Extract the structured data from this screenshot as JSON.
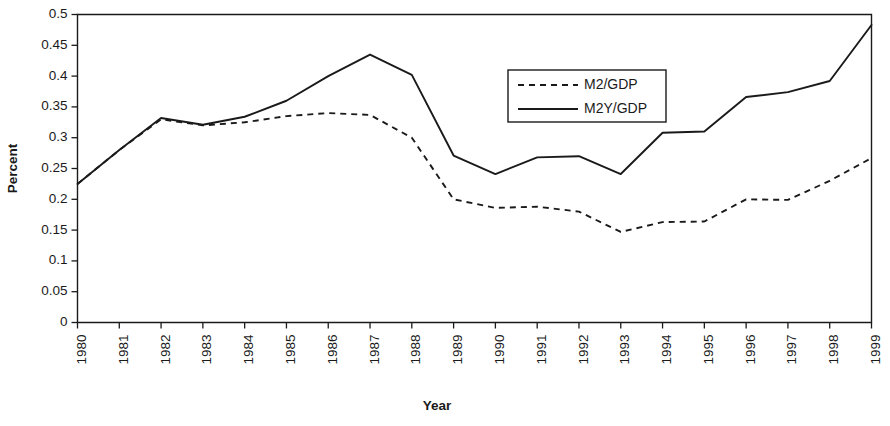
{
  "chart_data": {
    "type": "line",
    "title": "",
    "xlabel": "Year",
    "ylabel": "Percent",
    "grid": false,
    "legend_position": "upper-right-inside",
    "xlim": [
      1980,
      1999
    ],
    "ylim": [
      0,
      0.5
    ],
    "ytick_step": 0.05,
    "ytick_labels": [
      "0",
      "0.05",
      "0.1",
      "0.15",
      "0.2",
      "0.25",
      "0.3",
      "0.35",
      "0.4",
      "0.45",
      "0.5"
    ],
    "ytick_values": [
      0,
      0.05,
      0.1,
      0.15,
      0.2,
      0.25,
      0.3,
      0.35,
      0.4,
      0.45,
      0.5
    ],
    "categories": [
      "1980",
      "1981",
      "1982",
      "1983",
      "1984",
      "1985",
      "1986",
      "1987",
      "1988",
      "1989",
      "1990",
      "1991",
      "1992",
      "1993",
      "1994",
      "1995",
      "1996",
      "1997",
      "1998",
      "1999"
    ],
    "x": [
      1980,
      1981,
      1982,
      1983,
      1984,
      1985,
      1986,
      1987,
      1988,
      1989,
      1990,
      1991,
      1992,
      1993,
      1994,
      1995,
      1996,
      1997,
      1998,
      1999
    ],
    "series": [
      {
        "name": "M2/GDP",
        "style": "dashed",
        "color": "#1a1a1a",
        "values": [
          0.225,
          0.28,
          0.33,
          0.32,
          0.325,
          0.335,
          0.34,
          0.337,
          0.3,
          0.2,
          0.186,
          0.188,
          0.18,
          0.147,
          0.163,
          0.164,
          0.2,
          0.199,
          0.23,
          0.267
        ]
      },
      {
        "name": "M2Y/GDP",
        "style": "solid",
        "color": "#1a1a1a",
        "values": [
          0.225,
          0.28,
          0.332,
          0.321,
          0.334,
          0.36,
          0.4,
          0.435,
          0.402,
          0.271,
          0.241,
          0.268,
          0.27,
          0.241,
          0.308,
          0.31,
          0.366,
          0.374,
          0.392,
          0.483
        ]
      }
    ],
    "legend_entries": [
      {
        "label": "M2/GDP",
        "style": "dashed"
      },
      {
        "label": "M2Y/GDP",
        "style": "solid"
      }
    ]
  }
}
